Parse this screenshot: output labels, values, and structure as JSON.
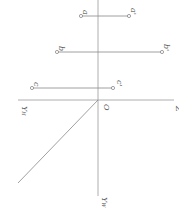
{
  "diagram": {
    "labels": {
      "a": "a",
      "a_prime": "a'",
      "b": "b",
      "b_prime": "b'",
      "c": "c",
      "c_prime": "c'",
      "origin": "O",
      "z": "Z",
      "yh": "Y",
      "yh_sub": "H",
      "yw": "Y",
      "yw_sub": "W"
    },
    "colors": {
      "line": "#888888",
      "text": "#555555"
    }
  }
}
